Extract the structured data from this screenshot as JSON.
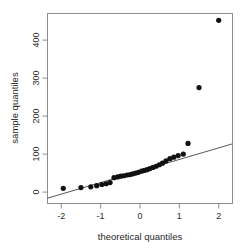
{
  "chart_data": {
    "type": "scatter",
    "title": "",
    "subtitle": "",
    "xlabel": "theoretical quantiles",
    "ylabel": "sample quantiles",
    "xlim": [
      -2.35,
      2.35
    ],
    "ylim": [
      -30,
      470
    ],
    "xticks": [
      -2,
      -1,
      0,
      1,
      2
    ],
    "xtick_labels": [
      "-2",
      "-1",
      "0",
      "1",
      "2"
    ],
    "yticks": [
      0,
      100,
      200,
      300,
      400
    ],
    "ytick_labels": [
      "0",
      "100",
      "200",
      "300",
      "400"
    ],
    "grid": false,
    "legend": null,
    "point_color": "#111111",
    "line_color": "#444444",
    "box_color": "#888888",
    "marker": "filled-circle",
    "marker_size": 2.6,
    "x": [
      -1.95,
      -1.5,
      -1.25,
      -1.1,
      -0.97,
      -0.86,
      -0.76,
      -0.66,
      -0.57,
      -0.49,
      -0.41,
      -0.33,
      -0.25,
      -0.18,
      -0.11,
      -0.04,
      0.04,
      0.11,
      0.18,
      0.25,
      0.33,
      0.41,
      0.49,
      0.57,
      0.66,
      0.76,
      0.86,
      0.97,
      1.1,
      1.22,
      1.5,
      2.0
    ],
    "y": [
      10,
      12,
      14,
      17,
      20,
      22,
      25,
      38,
      40,
      42,
      43,
      45,
      46,
      48,
      50,
      52,
      55,
      57,
      59,
      62,
      65,
      68,
      72,
      76,
      82,
      88,
      92,
      96,
      100,
      128,
      275,
      452
    ],
    "reference_line": {
      "name": "qqline",
      "x": [
        -2.35,
        2.35
      ],
      "y": [
        -16,
        127
      ]
    },
    "annotations": []
  },
  "axis": {
    "x_title": "theoretical quantiles",
    "y_title": "sample quantiles"
  }
}
